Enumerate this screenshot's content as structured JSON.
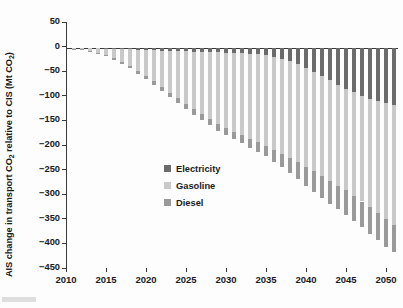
{
  "figure": {
    "background": "#fdfdfd",
    "plot_background": "#ffffff"
  },
  "axis": {
    "y_title_prefix": "AIS change in transport CO",
    "y_title_sub1": "2",
    "y_title_mid": " relative to CIS (Mt CO",
    "y_title_sub2": "2",
    "y_title_suffix": ")",
    "y_title_plain": "AIS change in transport CO2 relative to CIS (Mt CO2)",
    "y_ticks": [
      50,
      0,
      -50,
      -100,
      -150,
      -200,
      -250,
      -300,
      -350,
      -400,
      -450
    ],
    "y_tick_labels": [
      "50",
      "0",
      "−50",
      "−100",
      "−150",
      "−200",
      "−250",
      "−300",
      "−350",
      "−400",
      "−450"
    ],
    "x_ticks": [
      2010,
      2015,
      2020,
      2025,
      2030,
      2035,
      2040,
      2045,
      2050
    ],
    "x_tick_labels": [
      "2010",
      "2015",
      "2020",
      "2025",
      "2030",
      "2035",
      "2040",
      "2045",
      "2050"
    ]
  },
  "legend": {
    "items": [
      {
        "label": "Electricity",
        "color": "#6b6b6b"
      },
      {
        "label": "Gasoline",
        "color": "#c9c9c9"
      },
      {
        "label": "Diesel",
        "color": "#9a9a9a"
      }
    ]
  },
  "chart_data": {
    "type": "bar",
    "title": "",
    "subtitle": "",
    "xlabel": "",
    "ylabel": "AIS change in transport CO2 relative to CIS (Mt CO2)",
    "stacked": true,
    "grid": false,
    "legend_position": "inside-left-center",
    "xlim": [
      2010,
      2051.5
    ],
    "ylim": [
      -450,
      50
    ],
    "categories": [
      2011,
      2012,
      2013,
      2014,
      2015,
      2016,
      2017,
      2018,
      2019,
      2020,
      2021,
      2022,
      2023,
      2024,
      2025,
      2026,
      2027,
      2028,
      2029,
      2030,
      2031,
      2032,
      2033,
      2034,
      2035,
      2036,
      2037,
      2038,
      2039,
      2040,
      2041,
      2042,
      2043,
      2044,
      2045,
      2046,
      2047,
      2048,
      2049,
      2050,
      2051
    ],
    "series": [
      {
        "name": "Electricity",
        "color": "#6b6b6b",
        "values": [
          -0.2,
          -0.4,
          -0.7,
          -1.0,
          -1.4,
          -1.8,
          -2.3,
          -2.8,
          -3.4,
          -4.0,
          -4.6,
          -5.2,
          -5.8,
          -6.4,
          -7.0,
          -7.5,
          -8.0,
          -8.5,
          -9.0,
          -9.5,
          -10.0,
          -10.5,
          -11.5,
          -13.0,
          -15.0,
          -18.0,
          -22.0,
          -27.0,
          -33.0,
          -40.0,
          -48.0,
          -57.0,
          -66.0,
          -75.0,
          -83.0,
          -90.0,
          -97.0,
          -103.0,
          -108.0,
          -112.0,
          -115.0
        ]
      },
      {
        "name": "Gasoline",
        "color": "#c9c9c9",
        "values": [
          -1.0,
          -2.5,
          -5.0,
          -8.5,
          -13.0,
          -19.0,
          -26.0,
          -34.0,
          -43.0,
          -53.0,
          -63.0,
          -74.0,
          -85.0,
          -96.0,
          -107.0,
          -117.0,
          -127.0,
          -136.0,
          -145.0,
          -153.0,
          -160.0,
          -167.0,
          -173.0,
          -179.0,
          -184.0,
          -189.0,
          -193.0,
          -196.0,
          -199.0,
          -201.0,
          -202.0,
          -203.0,
          -204.0,
          -205.0,
          -206.0,
          -210.0,
          -215.0,
          -221.0,
          -228.0,
          -236.0,
          -245.0
        ]
      },
      {
        "name": "Diesel",
        "color": "#9a9a9a",
        "values": [
          -0.3,
          -0.7,
          -1.2,
          -1.8,
          -2.5,
          -3.2,
          -4.0,
          -4.8,
          -5.6,
          -6.5,
          -7.3,
          -8.1,
          -9.0,
          -9.8,
          -10.6,
          -11.4,
          -12.2,
          -13.0,
          -13.8,
          -14.6,
          -15.5,
          -16.5,
          -17.8,
          -19.5,
          -21.5,
          -24.0,
          -27.0,
          -30.5,
          -34.5,
          -39.0,
          -42.0,
          -44.5,
          -46.5,
          -48.0,
          -49.5,
          -51.0,
          -52.5,
          -54.0,
          -55.0,
          -55.5,
          -55.0
        ]
      }
    ],
    "totals": [
      -1.5,
      -3.6,
      -6.9,
      -11.3,
      -16.9,
      -24.0,
      -32.3,
      -41.6,
      -52.0,
      -63.5,
      -74.9,
      -87.3,
      -99.8,
      -112.2,
      -124.6,
      -135.9,
      -147.2,
      -157.5,
      -167.8,
      -177.1,
      -185.5,
      -194.0,
      -202.3,
      -211.5,
      -220.5,
      -231.0,
      -242.0,
      -253.5,
      -266.5,
      -280.0,
      -292.0,
      -304.5,
      -316.5,
      -328.0,
      -338.5,
      -351.0,
      -364.5,
      -378.0,
      -391.0,
      -403.5,
      -415.0
    ]
  }
}
